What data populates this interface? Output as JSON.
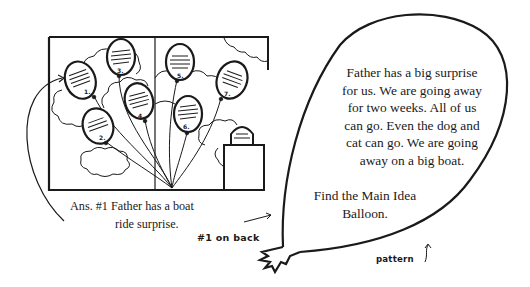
{
  "illustration": {
    "title": "Balloon picture",
    "balloons": [
      {
        "number": "1."
      },
      {
        "number": "2."
      },
      {
        "number": "3."
      },
      {
        "number": "4."
      },
      {
        "number": "5."
      },
      {
        "number": "6."
      },
      {
        "number": "7."
      }
    ],
    "colors": {
      "ink": "#1a1a1a",
      "paper": "#ffffff"
    }
  },
  "answer": {
    "line1": "Ans. #1 Father has a boat",
    "line2": "ride surprise."
  },
  "annotations": {
    "on_back": "#1 on back",
    "pattern": "pattern",
    "pattern_arrow": "↑"
  },
  "main_balloon": {
    "story_lines": [
      "Father has a big surprise",
      "for us. We are going away",
      "for two weeks. All of us",
      "can go. Even the dog and",
      "cat can go. We are going",
      "away on a big boat."
    ],
    "instruction_lines": [
      "Find the Main Idea",
      "Balloon."
    ]
  }
}
